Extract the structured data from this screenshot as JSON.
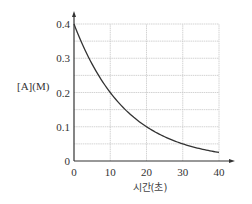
{
  "chart_data": {
    "type": "line",
    "title": "",
    "xlabel": "시간(초)",
    "ylabel": "[A](M)",
    "x_ticks": [
      0,
      10,
      20,
      30,
      40
    ],
    "y_ticks": [
      0,
      0.1,
      0.2,
      0.3,
      0.4
    ],
    "x_tick_labels": [
      "0",
      "10",
      "20",
      "30",
      "40"
    ],
    "y_tick_labels": [
      "0",
      "0.1",
      "0.2",
      "0.3",
      "0.4"
    ],
    "xlim": [
      0,
      40
    ],
    "ylim": [
      0,
      0.4
    ],
    "grid": true,
    "grid_x_step": 10,
    "grid_y_step": 0.05,
    "legend": null,
    "series": [
      {
        "name": "[A]",
        "x": [
          0,
          5,
          10,
          15,
          20,
          25,
          30,
          35,
          40
        ],
        "values": [
          0.4,
          0.283,
          0.2,
          0.141,
          0.1,
          0.071,
          0.05,
          0.035,
          0.025
        ]
      }
    ],
    "colors": {
      "curve": "#333333",
      "axis": "#333333",
      "grid": "#c8c8c8"
    }
  }
}
